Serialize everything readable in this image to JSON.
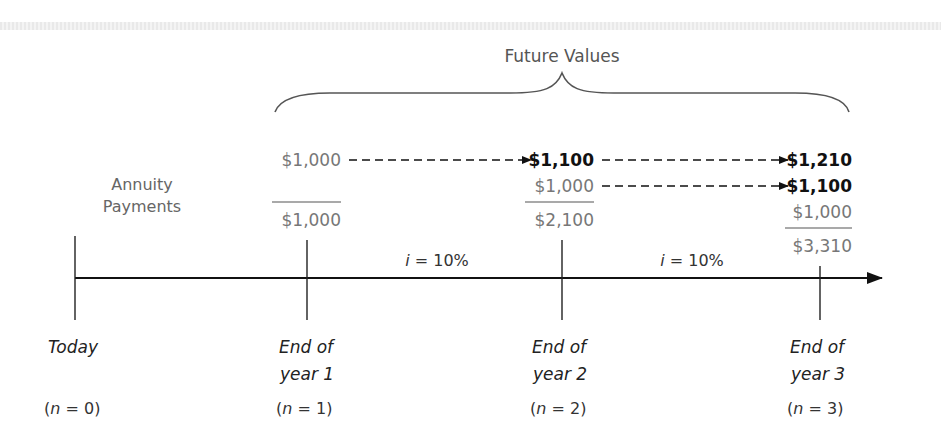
{
  "diagram": {
    "title": "Future Values",
    "left_label": {
      "line1": "Annuity",
      "line2": "Payments"
    },
    "colors": {
      "line": "#111111",
      "gray_text": "#777777",
      "bold_text": "#111111",
      "brace": "#555555"
    },
    "rows": {
      "row1": {
        "start": "$1,000",
        "mid": "$1,100",
        "end": "$1,210"
      },
      "row2": {
        "start": "$1,000",
        "end": "$1,100"
      },
      "row3": {
        "end": "$1,000"
      }
    },
    "totals": {
      "year1": "$1,000",
      "year2": "$2,100",
      "year3": "$3,310"
    },
    "rates": {
      "period1": "i = 10%",
      "period2": "i = 10%",
      "var": "i",
      "rest": " = 10%"
    },
    "timeline": [
      {
        "label1": "Today",
        "label2": "",
        "n_prefix": "(",
        "n_var": "n",
        "n_suffix": " = 0)"
      },
      {
        "label1": "End of",
        "label2": "year 1",
        "n_prefix": "(",
        "n_var": "n",
        "n_suffix": " = 1)"
      },
      {
        "label1": "End of",
        "label2": "year 2",
        "n_prefix": "(",
        "n_var": "n",
        "n_suffix": " = 2)"
      },
      {
        "label1": "End of",
        "label2": "year 3",
        "n_prefix": "(",
        "n_var": "n",
        "n_suffix": " = 3)"
      }
    ]
  }
}
